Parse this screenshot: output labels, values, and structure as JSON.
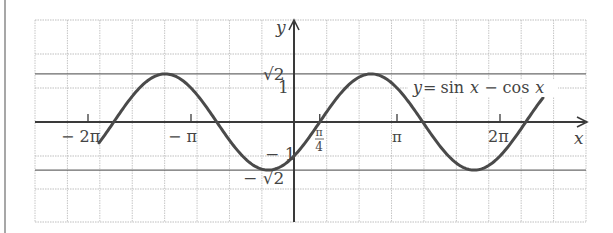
{
  "chart_data": {
    "type": "line",
    "title": "",
    "function_label": "y = sin x − cos x",
    "function_label_parts": {
      "y": "y",
      "eq": "=",
      "sin": "sin",
      "x1": "x",
      "minus": "−",
      "cos": "cos",
      "x2": "x"
    },
    "xlabel": "x",
    "ylabel": "y",
    "x_domain_radians": [
      -5.948,
      7.594
    ],
    "y_range": [
      -2.94,
      3.0
    ],
    "grid": true,
    "x_ticks": [
      {
        "value": -6.2832,
        "label": "− 2π"
      },
      {
        "value": -3.1416,
        "label": "− π"
      },
      {
        "value": 0.7854,
        "label": "π/4",
        "label_num": "π",
        "label_den": "4"
      },
      {
        "value": 3.1416,
        "label": "π"
      },
      {
        "value": 6.2832,
        "label": "2π"
      }
    ],
    "y_ticks": [
      {
        "value": 1.4142,
        "label": "√2"
      },
      {
        "value": 1,
        "label": "1"
      },
      {
        "value": -1,
        "label": "− 1"
      },
      {
        "value": -1.4142,
        "label": "− √2"
      }
    ],
    "reference_lines": [
      {
        "y": 1.4142,
        "style": "solid"
      },
      {
        "y": -1.4142,
        "style": "solid"
      }
    ],
    "key_points": [
      {
        "x": -5.4978,
        "y": 0,
        "note": "zero -7π/4"
      },
      {
        "x": -3.927,
        "y": 1.4142,
        "note": "max -5π/4"
      },
      {
        "x": -2.3562,
        "y": 0,
        "note": "zero -3π/4"
      },
      {
        "x": -0.7854,
        "y": -1.4142,
        "note": "min -π/4"
      },
      {
        "x": 0,
        "y": -1,
        "note": "y-intercept"
      },
      {
        "x": 0.7854,
        "y": 0,
        "note": "zero π/4"
      },
      {
        "x": 2.3562,
        "y": 1.4142,
        "note": "max 3π/4"
      },
      {
        "x": 3.927,
        "y": 0,
        "note": "zero 5π/4"
      },
      {
        "x": 5.4978,
        "y": -1.4142,
        "note": "min 7π/4"
      },
      {
        "x": 7.0686,
        "y": 0,
        "note": "zero 9π/4"
      }
    ],
    "series": [
      {
        "name": "y = sin x − cos x",
        "expression": "sin(x) - cos(x)",
        "color": "#4a4a4a"
      }
    ]
  },
  "colors": {
    "curve": "#4a4a4a",
    "axis": "#3a3a3a",
    "solid_ref": "#6a6a6a",
    "grid": "#b8b8b8",
    "text": "#444444"
  }
}
